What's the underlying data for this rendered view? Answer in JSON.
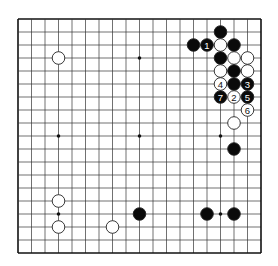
{
  "board": {
    "size": 19,
    "origin_x": 18,
    "origin_y": 19,
    "step_x": 13.5,
    "step_y": 13,
    "line_color": "#333333",
    "border_color": "#111111",
    "background": "#ffffff",
    "hoshi": [
      [
        3,
        3
      ],
      [
        9,
        3
      ],
      [
        3,
        9
      ],
      [
        9,
        9
      ],
      [
        15,
        9
      ],
      [
        3,
        15
      ],
      [
        15,
        15
      ]
    ]
  },
  "stones": [
    {
      "color": "white",
      "col": 3,
      "row": 3,
      "label": ""
    },
    {
      "color": "black",
      "col": 15,
      "row": 1,
      "label": ""
    },
    {
      "color": "black",
      "col": 13,
      "row": 2,
      "label": ""
    },
    {
      "color": "black",
      "col": 14,
      "row": 2,
      "label": "1"
    },
    {
      "color": "white",
      "col": 15,
      "row": 2,
      "label": ""
    },
    {
      "color": "black",
      "col": 16,
      "row": 2,
      "label": ""
    },
    {
      "color": "black",
      "col": 15,
      "row": 3,
      "label": ""
    },
    {
      "color": "white",
      "col": 16,
      "row": 3,
      "label": ""
    },
    {
      "color": "white",
      "col": 17,
      "row": 3,
      "label": ""
    },
    {
      "color": "white",
      "col": 15,
      "row": 4,
      "label": ""
    },
    {
      "color": "black",
      "col": 16,
      "row": 4,
      "label": ""
    },
    {
      "color": "white",
      "col": 17,
      "row": 4,
      "label": ""
    },
    {
      "color": "white",
      "col": 15,
      "row": 5,
      "label": "4"
    },
    {
      "color": "black",
      "col": 16,
      "row": 5,
      "label": ""
    },
    {
      "color": "black",
      "col": 17,
      "row": 5,
      "label": "3"
    },
    {
      "color": "black",
      "col": 15,
      "row": 6,
      "label": "7"
    },
    {
      "color": "white",
      "col": 16,
      "row": 6,
      "label": "2"
    },
    {
      "color": "black",
      "col": 17,
      "row": 6,
      "label": "5"
    },
    {
      "color": "white",
      "col": 17,
      "row": 7,
      "label": "6"
    },
    {
      "color": "white",
      "col": 16,
      "row": 8,
      "label": ""
    },
    {
      "color": "black",
      "col": 16,
      "row": 10,
      "label": ""
    },
    {
      "color": "white",
      "col": 3,
      "row": 14,
      "label": ""
    },
    {
      "color": "black",
      "col": 9,
      "row": 15,
      "label": ""
    },
    {
      "color": "black",
      "col": 14,
      "row": 15,
      "label": ""
    },
    {
      "color": "black",
      "col": 16,
      "row": 15,
      "label": ""
    },
    {
      "color": "white",
      "col": 3,
      "row": 16,
      "label": ""
    },
    {
      "color": "white",
      "col": 7,
      "row": 16,
      "label": ""
    }
  ],
  "colors": {
    "black_stone": "#0a0a0a",
    "white_stone": "#ffffff",
    "stone_outline": "#222222",
    "label_on_black": "#ffffff",
    "label_on_white": "#111111"
  }
}
